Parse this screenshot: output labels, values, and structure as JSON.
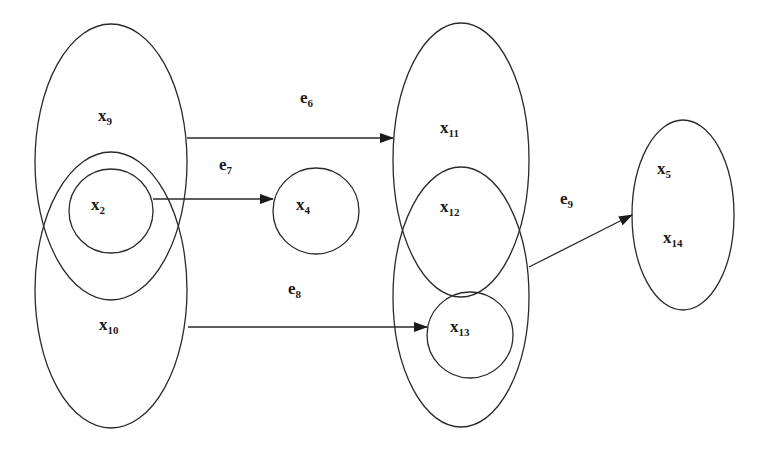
{
  "diagram": {
    "type": "hypergraph",
    "nodes": [
      {
        "id": "x9",
        "label": "x",
        "sub": "9"
      },
      {
        "id": "x10",
        "label": "x",
        "sub": "10"
      },
      {
        "id": "x2",
        "label": "x",
        "sub": "2"
      },
      {
        "id": "x4",
        "label": "x",
        "sub": "4"
      },
      {
        "id": "x11",
        "label": "x",
        "sub": "11"
      },
      {
        "id": "x12",
        "label": "x",
        "sub": "12"
      },
      {
        "id": "x13",
        "label": "x",
        "sub": "13"
      },
      {
        "id": "x5",
        "label": "x",
        "sub": "5"
      },
      {
        "id": "x14",
        "label": "x",
        "sub": "14"
      }
    ],
    "edges": [
      {
        "id": "e6",
        "label": "e",
        "sub": "6",
        "from": "x9",
        "to": "x11"
      },
      {
        "id": "e7",
        "label": "e",
        "sub": "7",
        "from": "x2",
        "to": "x4"
      },
      {
        "id": "e8",
        "label": "e",
        "sub": "8",
        "from": "x10",
        "to": "x13"
      },
      {
        "id": "e9",
        "label": "e",
        "sub": "9",
        "from": "x12",
        "to": "x5-x14"
      }
    ],
    "colors": {
      "stroke": "#2a2a2a",
      "background": "#ffffff"
    }
  }
}
